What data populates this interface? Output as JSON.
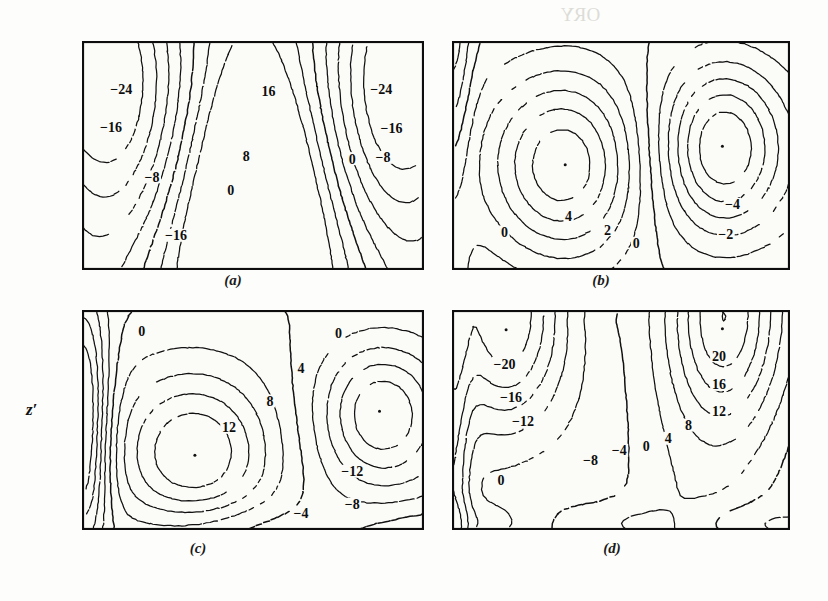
{
  "figure": {
    "axis_label_y": "z′",
    "background_showthrough": [
      {
        "text": "ORY",
        "x": 560,
        "y": 4
      },
      {
        "text": "w pattern in fron",
        "x": 470,
        "y": 84
      },
      {
        "text": "opposed by pressu",
        "x": 470,
        "y": 108
      },
      {
        "text": "s introduced by conv",
        "x": 470,
        "y": 132
      },
      {
        "text": "w is rather small; it mus",
        "x": 470,
        "y": 156
      },
      {
        "text": "to a rapid deceleration",
        "x": 470,
        "y": 180
      },
      {
        "text": "rtices in the flow. The",
        "x": 470,
        "y": 204
      },
      {
        "text": "nonlinearly. The instability proc",
        "x": 470,
        "y": 228
      }
    ]
  },
  "panels": [
    {
      "id": "a",
      "caption": "(a)",
      "x": 82,
      "y": 41,
      "w": 342,
      "h": 229,
      "caption_x": 233,
      "caption_y": 272,
      "y_ticks": [
        0.22,
        0.38,
        0.64
      ],
      "x_ticks": [
        0.25,
        0.5,
        0.75
      ],
      "labels": [
        {
          "text": "−24",
          "x": 0.115,
          "y": 0.215
        },
        {
          "text": "16",
          "x": 0.545,
          "y": 0.225
        },
        {
          "text": "−24",
          "x": 0.875,
          "y": 0.215
        },
        {
          "text": "−16",
          "x": 0.085,
          "y": 0.38
        },
        {
          "text": "−16",
          "x": 0.905,
          "y": 0.385
        },
        {
          "text": "8",
          "x": 0.48,
          "y": 0.51
        },
        {
          "text": "0",
          "x": 0.79,
          "y": 0.52
        },
        {
          "text": "−8",
          "x": 0.88,
          "y": 0.515
        },
        {
          "text": "−8",
          "x": 0.205,
          "y": 0.6
        },
        {
          "text": "0",
          "x": 0.435,
          "y": 0.655
        },
        {
          "text": "−16",
          "x": 0.275,
          "y": 0.855
        }
      ]
    },
    {
      "id": "b",
      "caption": "(b)",
      "x": 452,
      "y": 41,
      "w": 338,
      "h": 229,
      "caption_x": 601,
      "caption_y": 272,
      "y_ticks": [
        0.22,
        0.46,
        0.7
      ],
      "x_ticks": [
        0.25,
        0.5,
        0.75
      ],
      "centers": [
        {
          "x": 0.335,
          "y": 0.54
        },
        {
          "x": 0.8,
          "y": 0.46
        }
      ],
      "labels": [
        {
          "text": "4",
          "x": 0.345,
          "y": 0.77
        },
        {
          "text": "2",
          "x": 0.46,
          "y": 0.83
        },
        {
          "text": "0",
          "x": 0.155,
          "y": 0.84
        },
        {
          "text": "0",
          "x": 0.545,
          "y": 0.89
        },
        {
          "text": "−4",
          "x": 0.83,
          "y": 0.72
        },
        {
          "text": "−2",
          "x": 0.81,
          "y": 0.85
        }
      ]
    },
    {
      "id": "c",
      "caption": "(c)",
      "x": 82,
      "y": 310,
      "w": 342,
      "h": 220,
      "caption_x": 198,
      "caption_y": 540,
      "y_ticks": [
        0.22,
        0.45,
        0.7
      ],
      "x_ticks": [
        0.25,
        0.5,
        0.75
      ],
      "centers": [
        {
          "x": 0.33,
          "y": 0.66
        },
        {
          "x": 0.87,
          "y": 0.46
        }
      ],
      "labels": [
        {
          "text": "0",
          "x": 0.175,
          "y": 0.1
        },
        {
          "text": "0",
          "x": 0.75,
          "y": 0.11
        },
        {
          "text": "4",
          "x": 0.64,
          "y": 0.27
        },
        {
          "text": "8",
          "x": 0.55,
          "y": 0.42
        },
        {
          "text": "12",
          "x": 0.43,
          "y": 0.54
        },
        {
          "text": "−12",
          "x": 0.79,
          "y": 0.74
        },
        {
          "text": "−8",
          "x": 0.79,
          "y": 0.89
        },
        {
          "text": "−4",
          "x": 0.64,
          "y": 0.93
        }
      ]
    },
    {
      "id": "d",
      "caption": "(d)",
      "x": 452,
      "y": 310,
      "w": 338,
      "h": 220,
      "caption_x": 612,
      "caption_y": 540,
      "y_ticks": [
        0.22,
        0.45,
        0.7
      ],
      "x_ticks": [
        0.25,
        0.5,
        0.75
      ],
      "centers": [
        {
          "x": 0.16,
          "y": 0.09
        },
        {
          "x": 0.8,
          "y": 0.085
        }
      ],
      "labels": [
        {
          "text": "20",
          "x": 0.79,
          "y": 0.215
        },
        {
          "text": "−20",
          "x": 0.155,
          "y": 0.25
        },
        {
          "text": "16",
          "x": 0.79,
          "y": 0.345
        },
        {
          "text": "−16",
          "x": 0.175,
          "y": 0.4
        },
        {
          "text": "12",
          "x": 0.79,
          "y": 0.465
        },
        {
          "text": "−12",
          "x": 0.21,
          "y": 0.51
        },
        {
          "text": "8",
          "x": 0.7,
          "y": 0.53
        },
        {
          "text": "4",
          "x": 0.64,
          "y": 0.59
        },
        {
          "text": "0",
          "x": 0.575,
          "y": 0.625
        },
        {
          "text": "−4",
          "x": 0.495,
          "y": 0.645
        },
        {
          "text": "−8",
          "x": 0.41,
          "y": 0.69
        },
        {
          "text": "0",
          "x": 0.145,
          "y": 0.78
        }
      ]
    }
  ],
  "chart_data": {
    "type": "contour",
    "title": "",
    "xlabel": "",
    "ylabel": "z′",
    "grid": false,
    "legend": "none",
    "subplots": [
      {
        "id": "a",
        "caption": "(a)",
        "contour_interval": 8,
        "levels": [
          -24,
          -16,
          -8,
          0,
          8,
          16
        ],
        "labeled_values": [
          -24,
          -16,
          -8,
          0,
          8,
          16,
          -24,
          -16,
          -16
        ],
        "extrema": [
          {
            "type": "max",
            "value": 16,
            "x": 0.54,
            "y": 0.22
          },
          {
            "type": "min",
            "value": -24,
            "x": 0.1,
            "y": 0.2
          },
          {
            "type": "min",
            "value": -24,
            "x": 0.89,
            "y": 0.2
          },
          {
            "type": "min",
            "value": -16,
            "x": 0.28,
            "y": 0.88
          }
        ]
      },
      {
        "id": "b",
        "caption": "(b)",
        "contour_interval": 2,
        "levels": [
          -4,
          -2,
          0,
          2,
          4
        ],
        "labeled_values": [
          0,
          2,
          4,
          0,
          -2,
          -4
        ],
        "extrema": [
          {
            "type": "max",
            "value": 4,
            "x": 0.335,
            "y": 0.54
          },
          {
            "type": "min",
            "value": -4,
            "x": 0.8,
            "y": 0.46
          }
        ]
      },
      {
        "id": "c",
        "caption": "(c)",
        "contour_interval": 4,
        "levels": [
          -12,
          -8,
          -4,
          0,
          4,
          8,
          12
        ],
        "labeled_values": [
          0,
          0,
          4,
          8,
          12,
          -4,
          -8,
          -12
        ],
        "extrema": [
          {
            "type": "max",
            "value": 12,
            "x": 0.33,
            "y": 0.66
          },
          {
            "type": "min",
            "value": -12,
            "x": 0.87,
            "y": 0.46
          }
        ]
      },
      {
        "id": "d",
        "caption": "(d)",
        "contour_interval": 4,
        "levels": [
          -20,
          -16,
          -12,
          -8,
          -4,
          0,
          4,
          8,
          12,
          16,
          20
        ],
        "labeled_values": [
          -20,
          -16,
          -12,
          -8,
          -4,
          0,
          4,
          8,
          12,
          16,
          20,
          0
        ],
        "extrema": [
          {
            "type": "min",
            "value": -20,
            "x": 0.16,
            "y": 0.09
          },
          {
            "type": "max",
            "value": 20,
            "x": 0.8,
            "y": 0.085
          }
        ]
      }
    ]
  }
}
